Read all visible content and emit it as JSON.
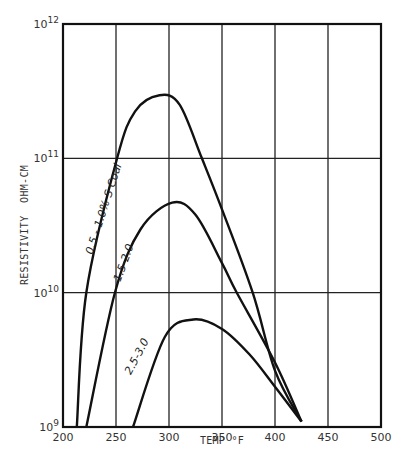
{
  "chart_data": {
    "type": "line",
    "title": "",
    "xlabel": "TEMP °F",
    "ylabel": "RESISTIVITY  OHM-CM",
    "xlim": [
      200,
      500
    ],
    "ylim": [
      1000000000.0,
      1000000000000.0
    ],
    "yscale": "log",
    "grid": true,
    "x_ticks": [
      "200",
      "250",
      "300",
      "350",
      "400",
      "450",
      "500"
    ],
    "y_ticks": [
      {
        "base": "10",
        "exp": "9"
      },
      {
        "base": "10",
        "exp": "10"
      },
      {
        "base": "10",
        "exp": "11"
      },
      {
        "base": "10",
        "exp": "12"
      }
    ],
    "series": [
      {
        "name": "0.5 - 1.0% S Coal",
        "x": [
          213,
          222,
          251,
          268,
          291,
          310,
          331,
          350,
          379,
          400,
          425
        ],
        "log10_y": [
          9.0,
          10.0,
          11.0,
          11.35,
          11.47,
          11.4,
          11.0,
          10.62,
          10.0,
          9.42,
          9.04
        ]
      },
      {
        "name": "1.5-2.0",
        "x": [
          222,
          249,
          273,
          303,
          325,
          350,
          364,
          400,
          425
        ],
        "log10_y": [
          9.0,
          10.0,
          10.47,
          10.67,
          10.58,
          10.22,
          10.0,
          9.48,
          9.04
        ]
      },
      {
        "name": "2.5-3.0",
        "x": [
          266,
          296,
          323,
          350,
          376,
          400,
          425
        ],
        "log10_y": [
          9.0,
          9.67,
          9.8,
          9.73,
          9.54,
          9.3,
          9.04
        ]
      }
    ],
    "annotations": [
      "0.5 - 1.0% S Coal",
      "1.5-2.0",
      "2.5-3.0"
    ],
    "legend": "none (curves labeled inline)"
  },
  "labels": {
    "xlabel": "TEMP °F",
    "ylabel": "RESISTIVITY  OHM-CM",
    "curve1": "0.5 - 1.0% S Coal",
    "curve2": "1.5-2.0",
    "curve3": "2.5-3.0"
  }
}
